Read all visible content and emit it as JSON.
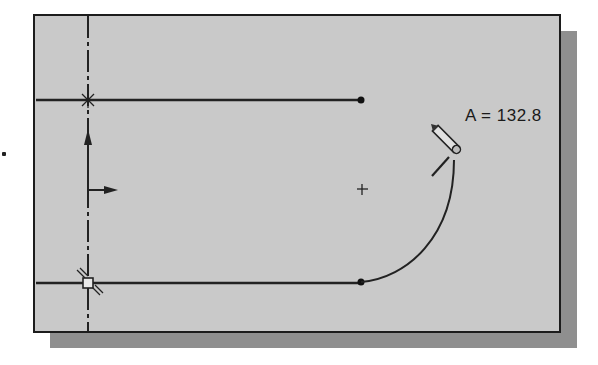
{
  "canvas": {
    "background_color": "#c9c9c9",
    "frame_color": "#1c1c1c",
    "shadow_color": "#8f8f8f"
  },
  "sketch": {
    "dimension_label": "A = 132.8",
    "entities": [
      {
        "type": "line",
        "name": "top-line",
        "from": [
          34,
          98
        ],
        "to": [
          359,
          98
        ]
      },
      {
        "type": "line",
        "name": "bottom-line",
        "from": [
          34,
          281
        ],
        "to": [
          359,
          281
        ]
      },
      {
        "type": "arc",
        "name": "rubber-band-arc",
        "from": [
          359,
          281
        ],
        "to": [
          452,
          155
        ],
        "center": [
          360,
          187
        ]
      },
      {
        "type": "centerline",
        "name": "vertical-centerline",
        "x": 86
      }
    ],
    "icons": [
      "origin-arrows-icon",
      "pencil-cursor-icon",
      "coincident-constraint-icon",
      "tangent-constraint-icon",
      "center-mark-icon"
    ]
  }
}
